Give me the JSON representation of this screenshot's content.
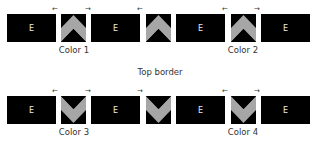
{
  "diagram": {
    "block_letter": "E",
    "colors": {
      "block": "#000000",
      "triangle": "#a6a6a6",
      "text": "#333333",
      "background": "#ffffff"
    },
    "arrows": {
      "left": "←",
      "right": "→"
    },
    "top_row": {
      "blocks": [
        {
          "label": "E"
        },
        {
          "label": "E"
        },
        {
          "label": "E"
        },
        {
          "label": "E"
        }
      ],
      "pieces": [
        {
          "orientation": "up"
        },
        {
          "orientation": "up"
        },
        {
          "orientation": "up"
        }
      ],
      "labels": [
        "Color 1",
        "Color 2"
      ]
    },
    "middle_label": "Top border",
    "bottom_row": {
      "blocks": [
        {
          "label": "E"
        },
        {
          "label": "E"
        },
        {
          "label": "E"
        },
        {
          "label": "E"
        }
      ],
      "pieces": [
        {
          "orientation": "down"
        },
        {
          "orientation": "down"
        },
        {
          "orientation": "down"
        }
      ],
      "labels": [
        "Color 3",
        "Color 4"
      ]
    }
  }
}
